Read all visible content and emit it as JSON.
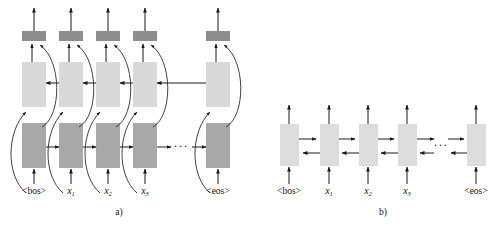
{
  "figure": {
    "panels": [
      {
        "id": "a",
        "caption": "a)",
        "description": "Deep bidirectional RNN with separate forward and backward layers feeding an output layer",
        "layers": [
          {
            "name": "output-layer",
            "role": "output",
            "color": "#8d8d8d",
            "cell_count": 5
          },
          {
            "name": "backward-layer",
            "role": "backward-recurrent",
            "color": "#d9d9d9",
            "cell_count": 5,
            "direction": "right-to-left"
          },
          {
            "name": "forward-layer",
            "role": "forward-recurrent",
            "color": "#a8a8a8",
            "cell_count": 5,
            "direction": "left-to-right"
          }
        ],
        "inputs": [
          {
            "text": "<bos>",
            "kind": "token"
          },
          {
            "text": "x",
            "sub": "1",
            "kind": "variable"
          },
          {
            "text": "x",
            "sub": "2",
            "kind": "variable"
          },
          {
            "text": "x",
            "sub": "3",
            "kind": "variable"
          },
          {
            "text": "<eos>",
            "kind": "token"
          }
        ],
        "ellipsis": "···"
      },
      {
        "id": "b",
        "caption": "b)",
        "description": "Single bidirectional recurrent layer with forward and backward arrows between cells",
        "layers": [
          {
            "name": "bidirectional-layer",
            "role": "bidirectional-recurrent",
            "color": "#dcdcdc",
            "cell_count": 5,
            "direction": "both"
          }
        ],
        "inputs": [
          {
            "text": "<bos>",
            "kind": "token"
          },
          {
            "text": "x",
            "sub": "1",
            "kind": "variable"
          },
          {
            "text": "x",
            "sub": "2",
            "kind": "variable"
          },
          {
            "text": "x",
            "sub": "3",
            "kind": "variable"
          },
          {
            "text": "<eos>",
            "kind": "token"
          }
        ],
        "ellipsis": "···"
      }
    ],
    "colors": {
      "output_cell": "#8d8d8d",
      "backward_cell": "#d9d9d9",
      "forward_cell": "#a8a8a8",
      "bidir_cell": "#dcdcdc",
      "stroke": "#1a1a1a",
      "background": "#ffffff"
    }
  }
}
